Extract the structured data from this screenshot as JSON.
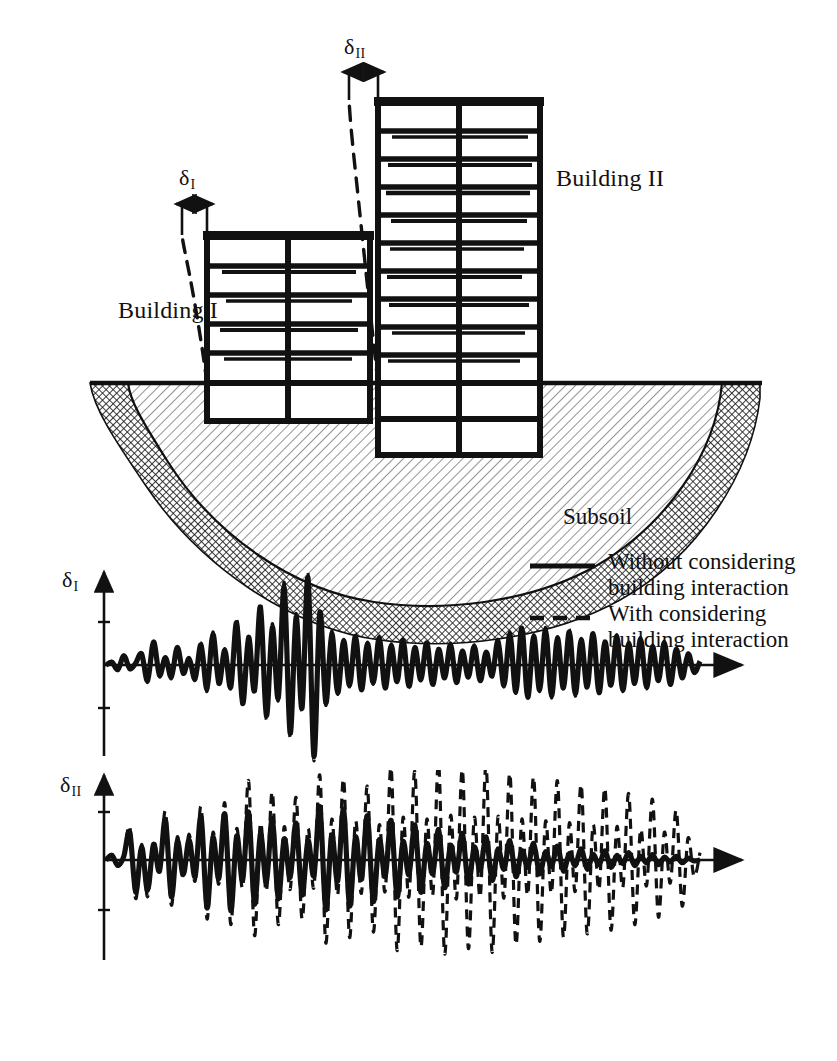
{
  "figure": {
    "title_visible": false,
    "background": "#ffffff",
    "ink": "#111111"
  },
  "scene": {
    "ground_label": "Subsoil",
    "buildings": [
      {
        "id": "building-1",
        "label": "Building I",
        "deflection_symbol": "δ",
        "deflection_subscript": "I",
        "floors_above_ground": 5,
        "floors_below_ground": 1,
        "bays": 2
      },
      {
        "id": "building-2",
        "label": "Building II",
        "deflection_symbol": "δ",
        "deflection_subscript": "II",
        "floors_above_ground": 10,
        "floors_below_ground": 2,
        "bays": 2
      }
    ]
  },
  "legend": {
    "entries": [
      {
        "style": "solid",
        "line1": "Without considering",
        "line2": "building interaction"
      },
      {
        "style": "dashed",
        "line1": "With considering",
        "line2": "building interaction"
      }
    ]
  },
  "chart_data": [
    {
      "id": "plot-delta-1",
      "type": "line",
      "title": "",
      "ylabel": "δ",
      "ylabel_subscript": "I",
      "xlabel": "",
      "xlim": [
        0,
        100
      ],
      "ylim": [
        -1.05,
        1.05
      ],
      "grid": false,
      "axis_arrow": "right",
      "y_ticks": [
        -0.5,
        0.5
      ],
      "legend_position": "external-right",
      "series": [
        {
          "name": "Without considering building interaction",
          "style": "solid",
          "values": [
            0.0,
            0.03,
            -0.05,
            0.1,
            -0.04,
            0.02,
            0.12,
            -0.17,
            0.25,
            -0.11,
            0.08,
            -0.13,
            0.19,
            -0.09,
            0.07,
            -0.15,
            0.22,
            -0.26,
            0.33,
            -0.2,
            0.16,
            -0.24,
            0.46,
            -0.42,
            0.3,
            -0.28,
            0.63,
            -0.55,
            0.41,
            -0.36,
            0.84,
            -0.74,
            0.52,
            -0.47,
            0.95,
            -0.99,
            0.57,
            -0.41,
            0.34,
            -0.3,
            0.26,
            -0.22,
            0.31,
            -0.27,
            0.23,
            -0.19,
            0.29,
            -0.25,
            0.21,
            -0.18,
            0.27,
            -0.23,
            0.19,
            -0.16,
            0.24,
            -0.21,
            0.17,
            -0.14,
            0.22,
            -0.19,
            0.15,
            -0.13,
            0.2,
            -0.17,
            0.14,
            -0.12,
            0.26,
            -0.22,
            0.33,
            -0.29,
            0.4,
            -0.35,
            0.31,
            -0.27,
            0.38,
            -0.33,
            0.29,
            -0.25,
            0.36,
            -0.31,
            0.27,
            -0.24,
            0.34,
            -0.3,
            0.25,
            -0.22,
            0.31,
            -0.27,
            0.23,
            -0.2,
            0.28,
            -0.24,
            0.2,
            -0.17,
            0.24,
            -0.21,
            0.17,
            -0.14,
            0.12,
            -0.08,
            0.04
          ]
        },
        {
          "name": "With considering building interaction",
          "style": "dashed",
          "values": [
            0.0,
            0.04,
            -0.06,
            0.11,
            -0.05,
            0.03,
            0.14,
            -0.19,
            0.27,
            -0.13,
            0.09,
            -0.15,
            0.21,
            -0.1,
            0.08,
            -0.17,
            0.24,
            -0.29,
            0.36,
            -0.22,
            0.18,
            -0.26,
            0.5,
            -0.46,
            0.33,
            -0.31,
            0.68,
            -0.6,
            0.45,
            -0.39,
            0.9,
            -0.8,
            0.56,
            -0.51,
            1.0,
            -1.04,
            0.61,
            -0.44,
            0.37,
            -0.32,
            0.28,
            -0.24,
            0.34,
            -0.29,
            0.25,
            -0.21,
            0.31,
            -0.27,
            0.23,
            -0.19,
            0.29,
            -0.25,
            0.21,
            -0.17,
            0.26,
            -0.23,
            0.18,
            -0.15,
            0.24,
            -0.21,
            0.16,
            -0.14,
            0.22,
            -0.18,
            0.15,
            -0.13,
            0.28,
            -0.24,
            0.36,
            -0.31,
            0.43,
            -0.38,
            0.33,
            -0.29,
            0.41,
            -0.36,
            0.31,
            -0.27,
            0.39,
            -0.34,
            0.29,
            -0.26,
            0.37,
            -0.32,
            0.27,
            -0.24,
            0.33,
            -0.29,
            0.25,
            -0.21,
            0.3,
            -0.26,
            0.22,
            -0.18,
            0.26,
            -0.22,
            0.18,
            -0.15,
            0.13,
            -0.09,
            0.05
          ]
        }
      ]
    },
    {
      "id": "plot-delta-2",
      "type": "line",
      "title": "",
      "ylabel": "δ",
      "ylabel_subscript": "II",
      "xlabel": "",
      "xlim": [
        0,
        100
      ],
      "ylim": [
        -1.15,
        1.15
      ],
      "grid": false,
      "axis_arrow": "right",
      "y_ticks": [
        -0.5,
        0.5
      ],
      "legend_position": "external-right",
      "series": [
        {
          "name": "Without considering building interaction",
          "style": "solid",
          "values": [
            0.0,
            0.05,
            -0.06,
            0.04,
            0.3,
            -0.35,
            0.14,
            -0.33,
            0.17,
            -0.12,
            0.44,
            -0.4,
            0.2,
            -0.16,
            0.22,
            -0.18,
            0.47,
            -0.52,
            0.24,
            -0.2,
            0.5,
            -0.55,
            0.26,
            -0.22,
            0.52,
            -0.48,
            0.28,
            -0.24,
            0.45,
            -0.42,
            0.23,
            -0.19,
            0.4,
            -0.38,
            0.21,
            -0.17,
            0.58,
            -0.54,
            0.27,
            -0.23,
            0.55,
            -0.5,
            0.25,
            -0.21,
            0.48,
            -0.45,
            0.22,
            -0.18,
            0.43,
            -0.4,
            0.2,
            -0.16,
            0.38,
            -0.35,
            0.18,
            -0.15,
            0.33,
            -0.3,
            0.16,
            -0.13,
            0.29,
            -0.26,
            0.14,
            -0.11,
            0.25,
            -0.22,
            0.12,
            -0.1,
            0.21,
            -0.18,
            0.1,
            -0.08,
            0.18,
            -0.15,
            0.09,
            -0.07,
            0.15,
            -0.12,
            0.07,
            -0.06,
            0.12,
            -0.1,
            0.06,
            -0.05,
            0.1,
            -0.08,
            0.05,
            -0.04,
            0.08,
            -0.06,
            0.04,
            -0.03,
            0.06,
            -0.05,
            0.03,
            -0.02,
            0.04,
            -0.03,
            0.02,
            -0.01,
            0.0
          ]
        },
        {
          "name": "With considering building interaction",
          "style": "dashed",
          "values": [
            0.0,
            0.06,
            -0.07,
            0.05,
            0.36,
            -0.42,
            0.17,
            -0.4,
            0.21,
            -0.15,
            0.53,
            -0.49,
            0.25,
            -0.2,
            0.28,
            -0.23,
            0.58,
            -0.64,
            0.3,
            -0.26,
            0.62,
            -0.7,
            0.34,
            -0.3,
            0.86,
            -0.82,
            0.4,
            -0.34,
            0.74,
            -0.7,
            0.36,
            -0.32,
            0.68,
            -0.64,
            0.34,
            -0.3,
            0.92,
            -0.9,
            0.44,
            -0.38,
            0.88,
            -0.84,
            0.42,
            -0.36,
            0.8,
            -0.78,
            0.38,
            -0.34,
            1.0,
            -0.98,
            0.46,
            -0.4,
            0.96,
            -0.94,
            0.44,
            -0.38,
            1.05,
            -1.02,
            0.48,
            -0.42,
            0.98,
            -0.96,
            0.46,
            -0.4,
            1.02,
            -1.0,
            0.47,
            -0.41,
            0.94,
            -0.92,
            0.44,
            -0.38,
            0.9,
            -0.88,
            0.42,
            -0.36,
            0.86,
            -0.84,
            0.4,
            -0.34,
            0.82,
            -0.8,
            0.38,
            -0.32,
            0.78,
            -0.76,
            0.36,
            -0.3,
            0.72,
            -0.7,
            0.33,
            -0.28,
            0.66,
            -0.62,
            0.3,
            -0.25,
            0.54,
            -0.5,
            0.24,
            -0.18,
            0.08
          ]
        }
      ]
    }
  ]
}
